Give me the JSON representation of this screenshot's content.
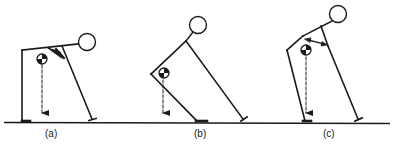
{
  "figure": {
    "panels": [
      {
        "id": "a",
        "label": "(a)"
      },
      {
        "id": "b",
        "label": "(b)"
      },
      {
        "id": "c",
        "label": "(c)"
      }
    ],
    "colors": {
      "line": "#1a1a1a",
      "background": "#ffffff"
    }
  }
}
